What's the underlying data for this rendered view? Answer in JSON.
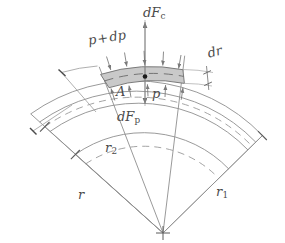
{
  "figure": {
    "kind": "physics-diagram",
    "background_color": "#ffffff",
    "line_color": "#8e8e8e",
    "dark_line_color": "#5a5a5a",
    "element_fill": "#c9c9c9",
    "element_stroke": "#707070",
    "label_color": "#4a4a4a",
    "arrow_color": "#6f6f6f",
    "center_dot_color": "#1a1a1a"
  },
  "labels": {
    "centrifugal_force": {
      "base": "dF",
      "sub": "c",
      "x": 143,
      "y": 6
    },
    "pressure_force": {
      "base": "dF",
      "sub": "p",
      "x": 117,
      "y": 110
    },
    "pressure_outer": {
      "text": "p",
      "op": "+",
      "text2": "dp",
      "x": 87,
      "y": 34
    },
    "pressure_inner": {
      "text": "p",
      "x": 152,
      "y": 87
    },
    "area": {
      "text": "A",
      "x": 116,
      "y": 85
    },
    "thickness": {
      "text": "dr",
      "x": 206,
      "y": 47
    },
    "radius_mean": {
      "base": "r",
      "sub": "",
      "x": 78,
      "y": 188
    },
    "radius_inner": {
      "base": "r",
      "sub": "2",
      "x": 105,
      "y": 141
    },
    "radius_outer": {
      "base": "r",
      "sub": "1",
      "x": 216,
      "y": 185
    }
  },
  "geometry": {
    "apex": {
      "x": 163,
      "y": 233
    },
    "arcs": [
      {
        "name": "outer-boundary-arc",
        "radius": 178,
        "style": "solid"
      },
      {
        "name": "element-outer-arc",
        "radius": 166,
        "style": "solid"
      },
      {
        "name": "mean-dashed-arc",
        "radius": 159,
        "style": "dashed"
      },
      {
        "name": "element-inner-arc",
        "radius": 152,
        "style": "solid"
      },
      {
        "name": "inner-boundary-arc",
        "radius": 118,
        "style": "solid"
      },
      {
        "name": "inner-dashed-arc",
        "radius": 104,
        "style": "dashed"
      }
    ],
    "radial_lines": [
      {
        "name": "sector-left-edge",
        "angle_deg": -138
      },
      {
        "name": "element-left-edge",
        "angle_deg": -111
      },
      {
        "name": "element-center-line",
        "angle_deg": -97
      },
      {
        "name": "element-right-edge",
        "angle_deg": -83
      },
      {
        "name": "sector-right-edge",
        "angle_deg": -56
      }
    ],
    "pressure_arrow_count_outer": 5,
    "pressure_arrow_count_inner": 5
  }
}
